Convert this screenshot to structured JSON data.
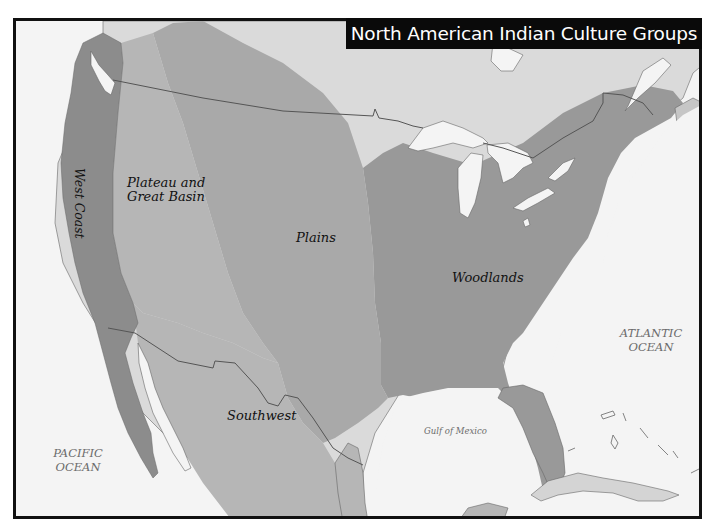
{
  "map": {
    "title": "North American Indian Culture Groups",
    "regions": [
      {
        "id": "west-coast",
        "label": "West Coast",
        "color": "#8c8c8c"
      },
      {
        "id": "plateau-great-basin",
        "label_line1": "Plateau and",
        "label_line2": "Great Basin",
        "color": "#b6b6b6"
      },
      {
        "id": "plains",
        "label": "Plains",
        "color": "#a9a9a9"
      },
      {
        "id": "woodlands",
        "label": "Woodlands",
        "color": "#999999"
      },
      {
        "id": "southwest",
        "label": "Southwest",
        "color": "#b6b6b6"
      }
    ],
    "water_bodies": {
      "pacific": {
        "line1": "PACIFIC",
        "line2": "OCEAN"
      },
      "atlantic": {
        "line1": "ATLANTIC",
        "line2": "OCEAN"
      },
      "gulf": "Gulf of Mexico"
    },
    "colors": {
      "water": "#f4f4f4",
      "unassigned_land": "#dadada",
      "lakes": "#f4f4f4",
      "border_line": "#555555",
      "title_bg": "#0a0a0a",
      "title_text": "#ffffff"
    }
  }
}
